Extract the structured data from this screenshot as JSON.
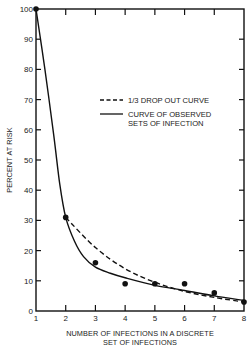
{
  "chart_data": {
    "type": "line",
    "title": "",
    "xlabel": "NUMBER OF INFECTIONS IN A DISCRETE SET OF INFECTIONS",
    "xlabel_lines": [
      "NUMBER OF INFECTIONS IN A DISCRETE",
      "SET OF INFECTIONS"
    ],
    "ylabel": "PERCENT AT RISK",
    "xlim": [
      1,
      8
    ],
    "ylim": [
      0,
      100
    ],
    "x_ticks": [
      1,
      2,
      3,
      4,
      5,
      6,
      7,
      8
    ],
    "y_ticks": [
      0,
      10,
      20,
      30,
      40,
      50,
      60,
      70,
      80,
      90,
      100
    ],
    "grid": false,
    "legend_position": "upper right (inside)",
    "legend": [
      {
        "name": "1/3 DROP OUT CURVE",
        "style": "dashed",
        "lines": [
          "1/3 DROP OUT CURVE"
        ]
      },
      {
        "name": "CURVE OF OBSERVED SETS OF INFECTION",
        "style": "solid",
        "lines": [
          "CURVE OF OBSERVED",
          "SETS OF INFECTION"
        ]
      }
    ],
    "observed_points": {
      "name": "Observed data",
      "x": [
        1,
        2,
        3,
        4,
        5,
        6,
        7,
        8
      ],
      "y": [
        100,
        31,
        16,
        9,
        9,
        9,
        6,
        3
      ]
    },
    "series": [
      {
        "name": "1/3 DROP OUT CURVE",
        "style": "dashed",
        "x": [
          2,
          3,
          4,
          5,
          6,
          7,
          8
        ],
        "y": [
          31,
          21,
          14,
          9.5,
          6.5,
          4.5,
          3
        ]
      },
      {
        "name": "CURVE OF OBSERVED SETS OF INFECTION",
        "style": "solid",
        "x": [
          1,
          1.3,
          1.6,
          1.8,
          2,
          2.3,
          2.6,
          3,
          3.5,
          4,
          5,
          6,
          7,
          8
        ],
        "y": [
          100,
          80,
          58,
          42,
          31,
          23,
          18,
          14.5,
          12.5,
          11,
          8.5,
          6.8,
          5,
          3.5
        ]
      }
    ]
  }
}
